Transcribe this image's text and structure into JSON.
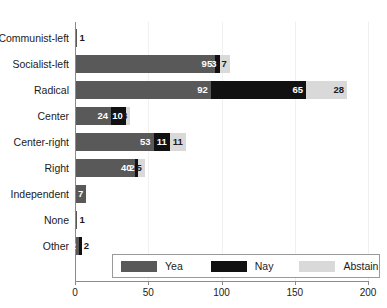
{
  "chart_data": {
    "type": "bar",
    "orientation": "horizontal",
    "stacked": true,
    "title": "",
    "xlabel": "",
    "ylabel": "",
    "xlim": [
      0,
      200
    ],
    "xticks": [
      0,
      50,
      100,
      150,
      200
    ],
    "xtick_labels": [
      "0",
      "50",
      "100",
      "150",
      "200"
    ],
    "grid": true,
    "legend_position": "bottom-center",
    "categories": [
      "Communist-left",
      "Socialist-left",
      "Radical",
      "Center",
      "Center-right",
      "Right",
      "Independent",
      "None",
      "Other"
    ],
    "series": [
      {
        "name": "Yea",
        "color": "#595959",
        "values": [
          1,
          95,
          92,
          24,
          53,
          40,
          7,
          1,
          2
        ]
      },
      {
        "name": "Nay",
        "color": "#111111",
        "values": [
          0,
          3,
          65,
          10,
          11,
          2,
          0,
          0,
          2
        ]
      },
      {
        "name": "Abstain",
        "color": "#d9d9d9",
        "values": [
          0,
          7,
          28,
          3,
          11,
          5,
          0,
          0,
          0
        ]
      }
    ],
    "rows": [
      {
        "label": "Communist-left",
        "segments": [
          {
            "series": "Yea",
            "value": 1,
            "label": "1",
            "show_label": true,
            "label_outside": true
          }
        ]
      },
      {
        "label": "Socialist-left",
        "segments": [
          {
            "series": "Yea",
            "value": 95,
            "label": "95",
            "show_label": true,
            "label_outside": false
          },
          {
            "series": "Nay",
            "value": 3,
            "label": "3",
            "show_label": true,
            "label_outside": false
          },
          {
            "series": "Abstain",
            "value": 7,
            "label": "7",
            "show_label": true,
            "label_outside": false
          }
        ]
      },
      {
        "label": "Radical",
        "segments": [
          {
            "series": "Yea",
            "value": 92,
            "label": "92",
            "show_label": true,
            "label_outside": false
          },
          {
            "series": "Nay",
            "value": 65,
            "label": "65",
            "show_label": true,
            "label_outside": false
          },
          {
            "series": "Abstain",
            "value": 28,
            "label": "28",
            "show_label": true,
            "label_outside": false
          }
        ]
      },
      {
        "label": "Center",
        "segments": [
          {
            "series": "Yea",
            "value": 24,
            "label": "24",
            "show_label": true,
            "label_outside": false
          },
          {
            "series": "Nay",
            "value": 10,
            "label": "10",
            "show_label": true,
            "label_outside": false
          },
          {
            "series": "Abstain",
            "value": 3,
            "label": "3",
            "show_label": true,
            "label_outside": false
          }
        ]
      },
      {
        "label": "Center-right",
        "segments": [
          {
            "series": "Yea",
            "value": 53,
            "label": "53",
            "show_label": true,
            "label_outside": false
          },
          {
            "series": "Nay",
            "value": 11,
            "label": "11",
            "show_label": true,
            "label_outside": false
          },
          {
            "series": "Abstain",
            "value": 11,
            "label": "11",
            "show_label": true,
            "label_outside": false
          }
        ]
      },
      {
        "label": "Right",
        "segments": [
          {
            "series": "Yea",
            "value": 40,
            "label": "40",
            "show_label": true,
            "label_outside": false
          },
          {
            "series": "Nay",
            "value": 2,
            "label": "2",
            "show_label": true,
            "label_outside": false
          },
          {
            "series": "Abstain",
            "value": 5,
            "label": "5",
            "show_label": true,
            "label_outside": false
          }
        ]
      },
      {
        "label": "Independent",
        "segments": [
          {
            "series": "Yea",
            "value": 7,
            "label": "7",
            "show_label": true,
            "label_outside": false
          }
        ]
      },
      {
        "label": "None",
        "segments": [
          {
            "series": "Yea",
            "value": 1,
            "label": "1",
            "show_label": true,
            "label_outside": true
          }
        ]
      },
      {
        "label": "Other",
        "segments": [
          {
            "series": "Yea",
            "value": 2,
            "label": "2",
            "show_label": true,
            "label_outside": false
          },
          {
            "series": "Nay",
            "value": 2,
            "label": "2",
            "show_label": true,
            "label_outside": true
          }
        ]
      }
    ]
  },
  "legend": {
    "items": [
      {
        "label": "Yea",
        "key": "yea"
      },
      {
        "label": "Nay",
        "key": "nay"
      },
      {
        "label": "Abstain",
        "key": "abs"
      }
    ]
  }
}
